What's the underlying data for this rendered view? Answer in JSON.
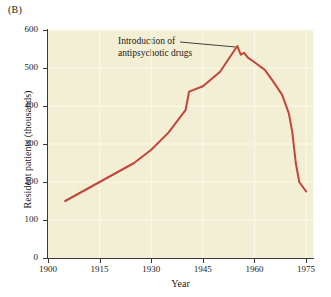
{
  "panel": {
    "label": "(B)"
  },
  "chart_data": {
    "type": "line",
    "title": "",
    "xlabel": "Year",
    "ylabel": "Resident patients (thousands)",
    "xlim": [
      1900,
      1977
    ],
    "ylim": [
      0,
      600
    ],
    "xticks": [
      1900,
      1915,
      1930,
      1945,
      1960,
      1975
    ],
    "yticks": [
      0,
      100,
      200,
      300,
      400,
      500,
      600
    ],
    "grid": true,
    "legend": "none",
    "series": [
      {
        "name": "Resident patients in state mental hospitals",
        "color": "#c4453c",
        "x": [
          1905,
          1910,
          1915,
          1920,
          1925,
          1930,
          1935,
          1940,
          1941,
          1945,
          1950,
          1955,
          1956,
          1957,
          1958,
          1960,
          1963,
          1965,
          1968,
          1970,
          1971,
          1972,
          1973,
          1975
        ],
        "values": [
          150,
          175,
          200,
          225,
          250,
          285,
          330,
          390,
          438,
          452,
          490,
          558,
          535,
          540,
          528,
          515,
          495,
          470,
          430,
          380,
          330,
          250,
          200,
          175
        ]
      }
    ],
    "annotations": [
      {
        "text_line1": "Introduction of",
        "text_line2": "antipsychotic drugs",
        "points_to_x": 1955,
        "points_to_y": 558
      }
    ]
  },
  "colors": {
    "line": "#c4453c",
    "plot_background": "#f3efd4",
    "page_background": "#ffffff",
    "axis": "#3a3a3a",
    "gridline": "#fbf9ec",
    "leader_line": "#2b2b2b"
  }
}
